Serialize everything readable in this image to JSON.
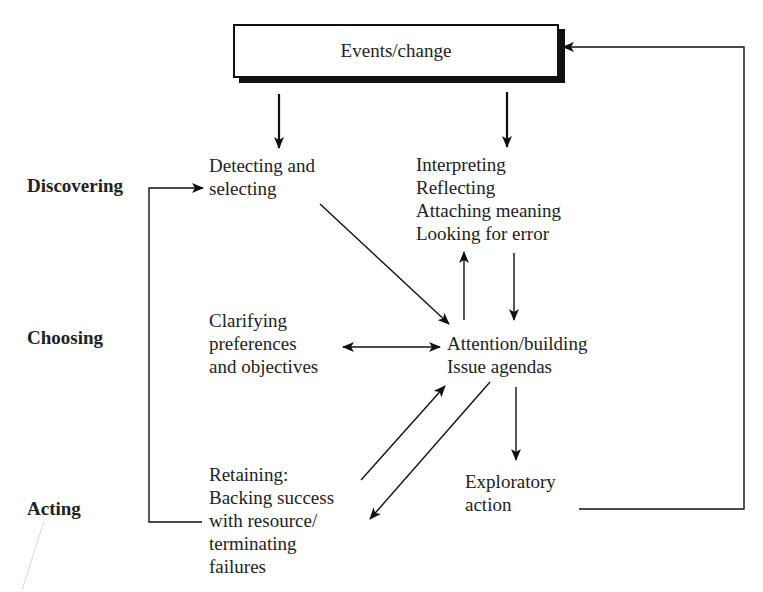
{
  "diagram": {
    "top_box": {
      "label": "Events/change"
    },
    "stages": {
      "discovering": "Discovering",
      "choosing": "Choosing",
      "acting": "Acting"
    },
    "nodes": {
      "detecting": [
        "Detecting and",
        "selecting"
      ],
      "interpreting": [
        "Interpreting",
        "Reflecting",
        "Attaching meaning",
        "Looking for error"
      ],
      "clarifying": [
        "Clarifying",
        "preferences",
        "and objectives"
      ],
      "attention": [
        "Attention/building",
        "Issue agendas"
      ],
      "retaining": [
        "Retaining:",
        "Backing success",
        "with resource/",
        "terminating",
        "failures"
      ],
      "exploratory": [
        "Exploratory",
        "action"
      ]
    },
    "edges": [
      {
        "from": "Events/change",
        "to": "Detecting and selecting"
      },
      {
        "from": "Events/change",
        "to": "Interpreting"
      },
      {
        "from": "Detecting and selecting",
        "to": "Attention/building"
      },
      {
        "from": "Attention/building",
        "to": "Interpreting"
      },
      {
        "from": "Interpreting",
        "to": "Attention/building"
      },
      {
        "from": "Clarifying preferences and objectives",
        "to": "Attention/building",
        "bidirectional": true
      },
      {
        "from": "Retaining",
        "to": "Attention/building"
      },
      {
        "from": "Attention/building",
        "to": "Retaining"
      },
      {
        "from": "Attention/building",
        "to": "Exploratory action"
      },
      {
        "from": "Exploratory action",
        "to": "Events/change",
        "type": "feedback-loop"
      },
      {
        "from": "Retaining",
        "to": "Detecting and selecting",
        "type": "feedback-loop"
      }
    ],
    "colors": {
      "ink": "#111111",
      "background": "#ffffff"
    }
  }
}
